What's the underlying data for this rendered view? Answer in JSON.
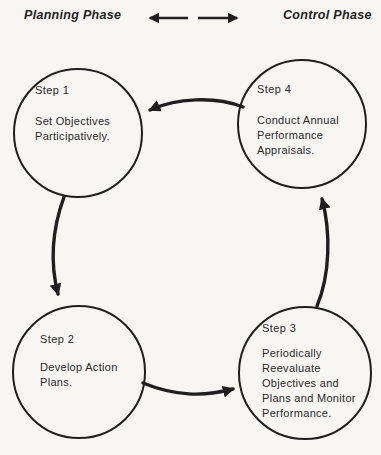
{
  "header": {
    "left_label": "Planning Phase",
    "right_label": "Control Phase"
  },
  "steps": [
    {
      "title": "Step 1",
      "description": "Set Objectives Participatively."
    },
    {
      "title": "Step 2",
      "description": "Develop Action Plans."
    },
    {
      "title": "Step 3",
      "description": "Periodically Reevaluate Objectives and Plans and Monitor Performance."
    },
    {
      "title": "Step 4",
      "description": "Conduct Annual Performance Appraisals."
    }
  ],
  "flow": [
    "Step 1",
    "Step 2",
    "Step 3",
    "Step 4",
    "Step 1"
  ],
  "colors": {
    "ink": "#1f1f1f",
    "background": "#f7f6f3"
  }
}
